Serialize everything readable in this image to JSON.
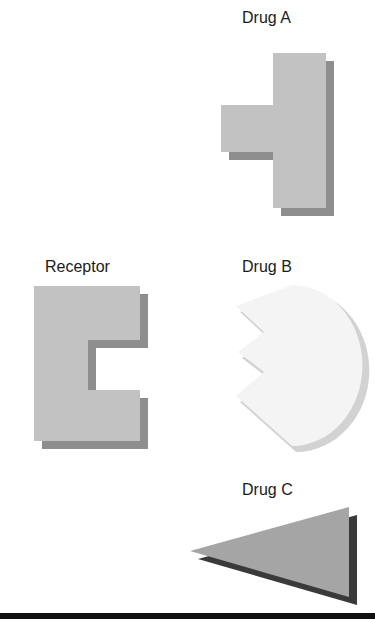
{
  "diagram": {
    "labels": {
      "drug_a": "Drug A",
      "receptor": "Receptor",
      "drug_b": "Drug B",
      "drug_c": "Drug C"
    },
    "colors": {
      "shape_fill": "#c2c2c2",
      "shadow": "#8e8e8e",
      "drug_b_fill": "#f4f4f4",
      "drug_b_shadow": "#d2d2d2",
      "drug_c_fill": "#a5a5a5",
      "drug_c_shadow": "#3a3a3a"
    },
    "shapes": [
      {
        "name": "Drug A",
        "form": "T-shape (key-like)"
      },
      {
        "name": "Receptor",
        "form": "C-shape with rectangular notch"
      },
      {
        "name": "Drug B",
        "form": "disc with zig-zag notched left edge"
      },
      {
        "name": "Drug C",
        "form": "triangle pointing left"
      }
    ]
  }
}
